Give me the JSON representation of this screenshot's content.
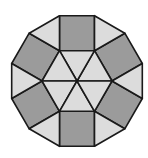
{
  "figure": {
    "shape": "regular dodecagon",
    "center": [
      77,
      81
    ],
    "unit_side": 35,
    "colors": {
      "square_fill": "#9b9b9b",
      "triangle_fill": "#dcdcdc",
      "stroke": "#1a1a1a",
      "background": "#ffffff"
    },
    "pieces": {
      "central_triangles": 6,
      "squares": 6,
      "outer_triangles": 6
    }
  }
}
